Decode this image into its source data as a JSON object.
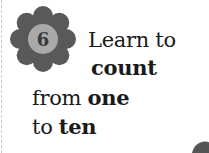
{
  "badge": {
    "number": "6",
    "icon": "flower-badge-icon",
    "petal_color": "#595959",
    "center_color": "#a9a9a9"
  },
  "heading": {
    "line1": "Learn to",
    "line2_bold": "count",
    "line3_regular": "from ",
    "line3_bold": "one",
    "line4_regular": "to ",
    "line4_bold": "ten"
  }
}
